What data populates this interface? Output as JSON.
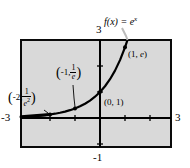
{
  "figure": {
    "kind": "math-graph",
    "background_color": "#ffffff",
    "plot_area_color": "#d9d9d9",
    "frame_color": "#0a0a0a",
    "curve_color": "#000000",
    "function_label": {
      "text": "f(x) = e^x",
      "f": "f",
      "open": "(",
      "x": "x",
      "close_eq": ") = ",
      "base": "e",
      "exponent": "x"
    },
    "axis_labels": {
      "top": "3",
      "right": "3",
      "left": "-3",
      "bottom": "-1"
    },
    "points": [
      {
        "name": "point-neg2",
        "text": "(-2, 1/e^2)",
        "x_part": "-2,",
        "num": "1",
        "den": "e",
        "den_sup": "2"
      },
      {
        "name": "point-neg1",
        "text": "(-1, 1/e)",
        "x_part": "-1,",
        "num": "1",
        "den": "e",
        "den_sup": ""
      },
      {
        "name": "point-origin",
        "text": "(0, 1)"
      },
      {
        "name": "point-one",
        "text": "(1, e)",
        "x_part": "(1, ",
        "e_part": "e",
        "close": ")"
      }
    ]
  },
  "chart_data": {
    "type": "line",
    "function": "y = e^x",
    "xlabel": "",
    "ylabel": "",
    "xlim": [
      -3,
      3
    ],
    "ylim": [
      -1,
      3
    ],
    "xticks": [
      -3,
      -2,
      -1,
      0,
      1,
      2,
      3
    ],
    "yticks": [
      -1,
      0,
      1,
      2,
      3
    ],
    "tick_labels_shown": {
      "x_left": "-3",
      "x_right": "3",
      "y_top": "3",
      "y_bottom": "-1"
    },
    "grid": false,
    "legend": "none",
    "annotations": [
      {
        "label": "(-2, 1/e²)",
        "x": -2,
        "y": 0.135
      },
      {
        "label": "(-1, 1/e)",
        "x": -1,
        "y": 0.368
      },
      {
        "label": "(0, 1)",
        "x": 0,
        "y": 1
      },
      {
        "label": "(1, e)",
        "x": 1,
        "y": 2.718
      }
    ],
    "x": [
      -3.0,
      -2.8,
      -2.6,
      -2.4,
      -2.2,
      -2.0,
      -1.8,
      -1.6,
      -1.4,
      -1.2,
      -1.0,
      -0.8,
      -0.6,
      -0.4,
      -0.2,
      0.0,
      0.2,
      0.4,
      0.6,
      0.8,
      1.0,
      1.1
    ],
    "values": [
      0.05,
      0.061,
      0.074,
      0.091,
      0.111,
      0.135,
      0.165,
      0.202,
      0.247,
      0.301,
      0.368,
      0.449,
      0.549,
      0.67,
      0.819,
      1.0,
      1.221,
      1.492,
      1.822,
      2.226,
      2.718,
      3.004
    ],
    "marked_points": [
      {
        "x": -2,
        "y": 0.135
      },
      {
        "x": -1,
        "y": 0.368
      },
      {
        "x": 0,
        "y": 1.0
      },
      {
        "x": 1,
        "y": 2.718
      }
    ]
  }
}
